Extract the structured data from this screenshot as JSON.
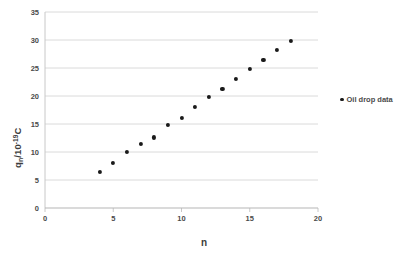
{
  "chart_data": {
    "type": "scatter",
    "title": "",
    "xlabel": "n",
    "ylabel": "q",
    "ylabel_sub": "n",
    "ylabel_rest": "/10",
    "ylabel_exp": "-19",
    "ylabel_unit": "C",
    "xlim": [
      0,
      20
    ],
    "ylim": [
      0,
      35
    ],
    "xticks": [
      "0",
      "5",
      "10",
      "15",
      "20"
    ],
    "xtick_values": [
      0,
      5,
      10,
      15,
      20
    ],
    "yticks": [
      "0",
      "5",
      "10",
      "15",
      "20",
      "25",
      "30",
      "35"
    ],
    "ytick_values": [
      0,
      5,
      10,
      15,
      20,
      25,
      30,
      35
    ],
    "grid": "horizontal",
    "legend_position": "right",
    "series": [
      {
        "name": "Oil drop data",
        "marker": "circle",
        "color": "#1a1a1a",
        "x": [
          4,
          5,
          6,
          7,
          8,
          9,
          10,
          11,
          12,
          13,
          14,
          15,
          16,
          17,
          18
        ],
        "values": [
          6.5,
          8.1,
          10.0,
          11.5,
          12.6,
          14.9,
          16.1,
          18.1,
          19.9,
          21.3,
          23.0,
          24.9,
          26.4,
          28.2,
          29.9
        ]
      }
    ]
  },
  "legend": {
    "entries": [
      {
        "label": "Oil drop data"
      }
    ]
  },
  "axes": {
    "x_title": "n",
    "y_title_parts": {
      "q": "q",
      "n": "n",
      "slash10": "/10",
      "exp": "-19",
      "unit": "C"
    }
  }
}
